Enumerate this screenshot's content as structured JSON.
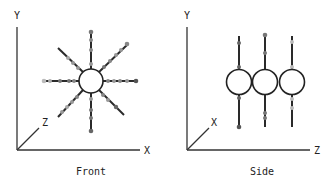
{
  "panels": [
    {
      "caption": "Front",
      "axes": {
        "vertical": "Y",
        "horizontal": "X",
        "depth": "Z"
      }
    },
    {
      "caption": "Side",
      "axes": {
        "vertical": "Y",
        "horizontal": "Z",
        "depth": "X"
      }
    }
  ],
  "colors": {
    "line": "#2a2a2a",
    "dot_dark": "#555555",
    "dot_mid": "#7a7a7a",
    "dot_light": "#b0b0b0"
  }
}
